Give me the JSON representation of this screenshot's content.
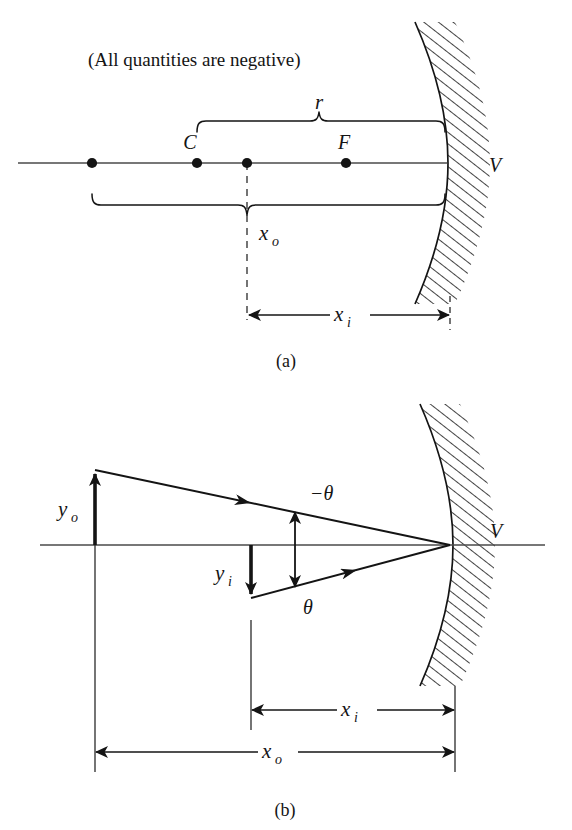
{
  "figure": {
    "domain": "Diagram",
    "background_color": "#ffffff",
    "line_color": "#141414",
    "axis_color": "#555555",
    "hatch_color": "#141414"
  },
  "panel_a": {
    "caption": "(a)",
    "note": "(All quantities are negative)",
    "axis_label_v": "V",
    "point_labels": {
      "center_of_curvature": "C",
      "focal_point": "F"
    },
    "brace_r_label": "r",
    "brace_xo_label": "x",
    "brace_xo_sub": "o",
    "dimension_xi_label": "x",
    "dimension_xi_sub": "i",
    "points_on_axis": [
      {
        "name": "object-point-far-left",
        "x": 92
      },
      {
        "name": "center-of-curvature-C",
        "x": 197
      },
      {
        "name": "virtual-object-point",
        "x": 247
      },
      {
        "name": "focal-point-F",
        "x": 346
      }
    ],
    "mirror_vertex_x": 445,
    "axis_y": 163
  },
  "panel_b": {
    "caption": "(b)",
    "axis_label_v": "V",
    "object_height_label": "y",
    "object_height_sub": "o",
    "image_height_label": "y",
    "image_height_sub": "i",
    "angle_upper_label": "−θ",
    "angle_lower_label": "θ",
    "dimension_xi_label": "x",
    "dimension_xi_sub": "i",
    "dimension_xo_label": "x",
    "dimension_xo_sub": "o",
    "object_x": 95,
    "image_x": 251,
    "mirror_vertex_x": 450,
    "axis_y": 545,
    "object_tip_y": 470,
    "image_tip_y": 598
  },
  "top_clipped_line": ""
}
